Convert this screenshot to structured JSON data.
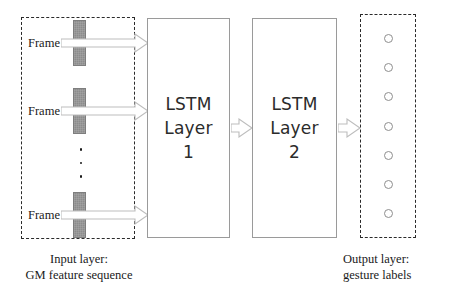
{
  "diagram": {
    "colors": {
      "frame_bar_fill": "#8c8c8c",
      "box_border": "#9a9a9a",
      "dashed_border": "#2a2a2a",
      "arrow_outline": "#b5b5b5",
      "node_border": "#8e8e8e",
      "text": "#1a1a1a",
      "background": "#ffffff"
    }
  },
  "input_layer": {
    "frames": [
      {
        "label": "Frame 1",
        "bar_icon": "feature-bar-icon"
      },
      {
        "label": "Frame 2",
        "bar_icon": "feature-bar-icon"
      },
      {
        "label": "Frame T",
        "bar_icon": "feature-bar-icon"
      }
    ],
    "ellipsis": "⋮",
    "caption": {
      "line1": "Input layer:",
      "line2": "GM feature sequence"
    }
  },
  "hidden_layers": [
    {
      "name": "LSTM Layer 1",
      "line1": "LSTM",
      "line2": "Layer",
      "line3": "1"
    },
    {
      "name": "LSTM Layer 2",
      "line1": "LSTM",
      "line2": "Layer",
      "line3": "2"
    }
  ],
  "arrows": [
    {
      "name": "arrow-frame-1-to-lstm1"
    },
    {
      "name": "arrow-frame-2-to-lstm1"
    },
    {
      "name": "arrow-frame-t-to-lstm1"
    },
    {
      "name": "arrow-lstm1-to-lstm2"
    },
    {
      "name": "arrow-lstm2-to-output"
    }
  ],
  "output_layer": {
    "node_count": 7,
    "caption": {
      "line1": "Output layer:",
      "line2": "gesture labels"
    }
  }
}
